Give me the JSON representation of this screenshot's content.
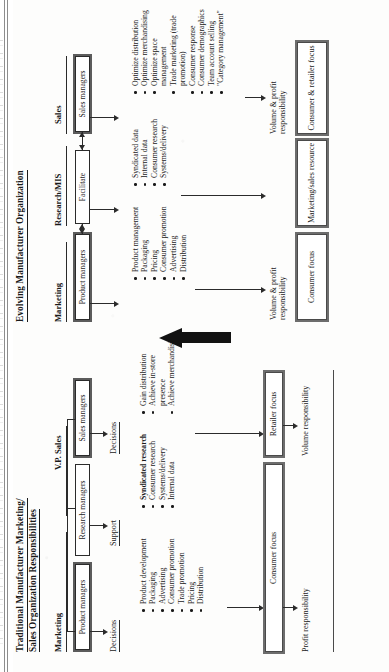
{
  "document": {
    "type": "scanned-book-page",
    "orientation": "rotated-90-ccw"
  },
  "traditional": {
    "title_line1": "Traditional Manufacturer Marketing/",
    "title_line2": "Sales Organization Responsibilities",
    "columns": [
      {
        "header": "Marketing",
        "role_box": "Product managers",
        "action": "Decisions",
        "bullets": [
          "Product development",
          "Packaging",
          "Advertising",
          "Consumer promotion",
          "Trade promotion",
          "Pricing",
          "Distribution"
        ]
      },
      {
        "header": "",
        "role_box": "Research managers",
        "action": "Support",
        "bullets": [
          "Syndicated research",
          "Consumer research",
          "Systems/delivery",
          "Internal data"
        ],
        "bold_first_bullet": true
      },
      {
        "header": "V.P. Sales",
        "role_box": "Sales managers",
        "action": "Decisions",
        "bullets": [
          "Gain distribution",
          "Achieve in-store presence",
          "Achieve merchandising"
        ]
      }
    ],
    "outcomes": [
      {
        "box": "Consumer focus",
        "responsibility": "Profit responsibility"
      },
      {
        "box": "Retailer focus",
        "responsibility": "Volume responsibility"
      }
    ]
  },
  "evolving": {
    "title": "Evolving Manufacturer Organization",
    "columns": [
      {
        "header": "Marketing",
        "role_box": "Product managers",
        "bullets": [
          "Product management",
          "Packaging",
          "Pricing",
          "Consumer promotion",
          "Advertising",
          "Distribution"
        ]
      },
      {
        "header": "Research/MIS",
        "role_box": "Facilitate",
        "bullets": [
          "Syndicated data",
          "Internal data",
          "Consumer research",
          "Systems/delivery"
        ]
      },
      {
        "header": "Sales",
        "role_box": "Sales managers",
        "bullets": [
          "Optimize distribution",
          "Optimize merchandising",
          "Optimize space management",
          "Trade marketing (trade promotion)",
          "Consumer response",
          "Consumer demographics",
          "Team account selling",
          "\"Category management\""
        ]
      }
    ],
    "outcomes": [
      {
        "responsibility": "Volume & profit responsibility",
        "box": "Consumer focus"
      },
      {
        "responsibility": "",
        "box": "Marketing/sales resource"
      },
      {
        "responsibility": "Volume & profit responsibility",
        "box": "Consumer & retailer focus"
      }
    ]
  }
}
